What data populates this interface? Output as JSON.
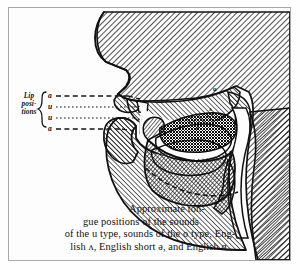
{
  "figure": {
    "type": "sagittal-head-section-engraving"
  },
  "lip_positions": {
    "label_line_1": "Lip",
    "label_line_2": "posi-",
    "label_line_3": "tions",
    "bracket": "{",
    "keys": [
      {
        "symbol": "ɑ",
        "line_style": "dashed"
      },
      {
        "symbol": "u",
        "line_style": "dotted"
      },
      {
        "symbol": "u",
        "line_style": "dotted"
      },
      {
        "symbol": "ɑ",
        "line_style": "dashed"
      }
    ]
  },
  "tongue_marks": [
    {
      "symbol": "u"
    },
    {
      "symbol": "ʌ"
    },
    {
      "symbol": "ɑ"
    }
  ],
  "caption": {
    "line1": "Approximate ton-",
    "line2": "gue positions of the sounds",
    "line3": "of the u type, sounds of the o type, Eng-",
    "line4": "lish ʌ, English short ə, and English ɑ."
  },
  "colors": {
    "ink": "#111111",
    "paper": "#fdfdfd",
    "frame": "#a8a8a8",
    "hatch": "#1a1a1a"
  }
}
